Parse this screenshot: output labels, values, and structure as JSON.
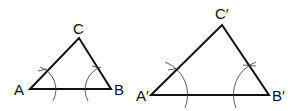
{
  "diagram": {
    "colors": {
      "stroke": "#111111",
      "arc": "#333333",
      "background": "#ffffff"
    },
    "triangles": [
      {
        "name": "ABC",
        "vertices": {
          "A": [
            30,
            89
          ],
          "B": [
            111,
            89
          ],
          "C": [
            79,
            38
          ]
        },
        "labels": {
          "A": "A",
          "B": "B",
          "C": "C"
        },
        "arcs": {
          "A": {
            "r": 24
          },
          "B": {
            "r": 24
          }
        }
      },
      {
        "name": "A'B'C'",
        "vertices": {
          "A": [
            151,
            95
          ],
          "B": [
            269,
            95
          ],
          "C": [
            222,
            25
          ]
        },
        "labels": {
          "A": "A′",
          "B": "B′",
          "C": "C′"
        },
        "arcs": {
          "A": {
            "r": 35
          },
          "B": {
            "r": 35
          }
        }
      }
    ]
  }
}
